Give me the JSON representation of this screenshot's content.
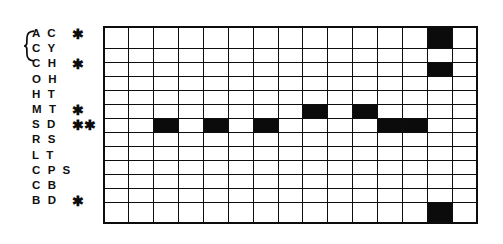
{
  "figure": {
    "type": "binary-presence-matrix",
    "rows": 13,
    "columns": 15,
    "marker_symbol": "✱",
    "brace_groups": [
      {
        "label": "",
        "rows": [
          3,
          4
        ]
      }
    ],
    "colors": {
      "filled_cell": "#0b0b0b",
      "empty_cell": "#ffffff",
      "grid_line": "#0d0d0d",
      "text": "#101010"
    },
    "row_labels": [
      {
        "codes": "A C",
        "star": "✱"
      },
      {
        "codes": "C Y",
        "star": ""
      },
      {
        "codes": "C H",
        "star": "✱"
      },
      {
        "codes": "O H",
        "star": ""
      },
      {
        "codes": "H T",
        "star": ""
      },
      {
        "codes": "M T",
        "star": "✱"
      },
      {
        "codes": "S D",
        "star": "✱✱"
      },
      {
        "codes": "R S",
        "star": ""
      },
      {
        "codes": "L T",
        "star": ""
      },
      {
        "codes": "C P S",
        "star": ""
      },
      {
        "codes": "C B",
        "star": ""
      },
      {
        "codes": "B D",
        "star": "✱"
      }
    ],
    "matrix": [
      [
        0,
        0,
        0,
        0,
        0,
        0,
        0,
        0,
        0,
        0,
        0,
        0,
        0,
        1,
        0
      ],
      [
        0,
        0,
        0,
        0,
        0,
        0,
        0,
        0,
        0,
        0,
        0,
        0,
        0,
        0,
        0
      ],
      [
        0,
        0,
        0,
        0,
        0,
        0,
        0,
        0,
        0,
        0,
        0,
        0,
        0,
        1,
        0
      ],
      [
        0,
        0,
        0,
        0,
        0,
        0,
        0,
        0,
        0,
        0,
        0,
        0,
        0,
        0,
        0
      ],
      [
        0,
        0,
        0,
        0,
        0,
        0,
        0,
        0,
        0,
        0,
        0,
        0,
        0,
        0,
        0
      ],
      [
        0,
        0,
        0,
        0,
        0,
        0,
        0,
        0,
        1,
        0,
        1,
        0,
        0,
        0,
        0
      ],
      [
        0,
        0,
        1,
        0,
        1,
        0,
        1,
        0,
        0,
        0,
        0,
        1,
        1,
        0,
        0
      ],
      [
        0,
        0,
        0,
        0,
        0,
        0,
        0,
        0,
        0,
        0,
        0,
        0,
        0,
        0,
        0
      ],
      [
        0,
        0,
        0,
        0,
        0,
        0,
        0,
        0,
        0,
        0,
        0,
        0,
        0,
        0,
        0
      ],
      [
        0,
        0,
        0,
        0,
        0,
        0,
        0,
        0,
        0,
        0,
        0,
        0,
        0,
        0,
        0
      ],
      [
        0,
        0,
        0,
        0,
        0,
        0,
        0,
        0,
        0,
        0,
        0,
        0,
        0,
        0,
        0
      ],
      [
        0,
        0,
        0,
        0,
        0,
        0,
        0,
        0,
        0,
        0,
        0,
        0,
        0,
        0,
        0
      ],
      [
        0,
        0,
        0,
        0,
        0,
        0,
        0,
        0,
        0,
        0,
        0,
        0,
        0,
        1,
        0
      ]
    ]
  }
}
